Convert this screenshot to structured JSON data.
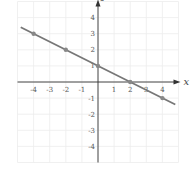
{
  "chart_data": {
    "type": "line",
    "title": "",
    "xlabel": "x",
    "ylabel": "y",
    "xlim": [
      -5,
      5
    ],
    "ylim": [
      -5,
      5
    ],
    "grid": true,
    "x_ticks": [
      -4,
      -3,
      -2,
      -1,
      1,
      2,
      3,
      4
    ],
    "y_ticks": [
      4,
      3,
      2,
      1,
      -1,
      -2,
      -3,
      -4
    ],
    "x_tick_labels": [
      "-4",
      "-3",
      "-2",
      "-1",
      "1",
      "2",
      "3",
      "4"
    ],
    "y_tick_labels": [
      "4",
      "3",
      "2",
      "1",
      "-1",
      "-2",
      "-3",
      "-4"
    ],
    "series": [
      {
        "name": "line",
        "x": [
          -4,
          -2,
          0,
          2,
          4
        ],
        "y": [
          3,
          2,
          1,
          0,
          -1
        ],
        "line_extent": [
          [
            -4.8,
            3.4
          ],
          [
            4.8,
            -1.4
          ]
        ]
      }
    ],
    "colors": {
      "line": "#777777",
      "grid": "#ececec",
      "axis": "#333333",
      "point": "#888888"
    }
  }
}
